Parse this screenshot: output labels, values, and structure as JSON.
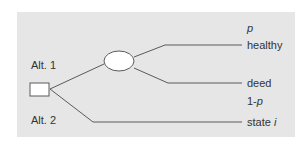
{
  "diagram": {
    "type": "decision-tree",
    "colors": {
      "background": "#e6e6e6",
      "line": "#5a5a5a",
      "node_fill": "#ffffff",
      "text": "#333333"
    },
    "decision_node": {
      "shape": "square",
      "label": ""
    },
    "chance_node": {
      "shape": "ellipse",
      "label": ""
    },
    "alternatives": [
      {
        "label": "Alt. 1"
      },
      {
        "label": "Alt. 2"
      }
    ],
    "outcomes": [
      {
        "label": "healthy",
        "probability_label": "p",
        "branch_of": "Alt. 1"
      },
      {
        "label": "deed",
        "probability_prefix": "1-",
        "probability_var": "p",
        "branch_of": "Alt. 1"
      },
      {
        "label_prefix": "state ",
        "label_var": "i",
        "branch_of": "Alt. 2"
      }
    ]
  }
}
